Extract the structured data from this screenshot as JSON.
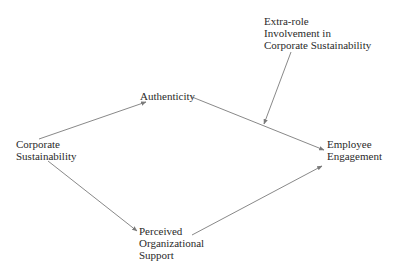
{
  "diagram": {
    "type": "path-model",
    "nodes": {
      "moderator": {
        "lines": [
          "Extra-role",
          "Involvement in",
          "Corporate Sustainability"
        ]
      },
      "authenticity": {
        "lines": [
          "Authenticity"
        ]
      },
      "corporate_sustainability": {
        "lines": [
          "Corporate",
          "Sustainability"
        ]
      },
      "employee_engagement": {
        "lines": [
          "Employee",
          "Engagement"
        ]
      },
      "perceived_org_support": {
        "lines": [
          "Perceived",
          "Organizational",
          "Support"
        ]
      }
    },
    "edges": [
      {
        "from": "Corporate Sustainability",
        "to": "Authenticity"
      },
      {
        "from": "Authenticity",
        "to": "Employee Engagement"
      },
      {
        "from": "Corporate Sustainability",
        "to": "Perceived Organizational Support"
      },
      {
        "from": "Perceived Organizational Support",
        "to": "Employee Engagement"
      },
      {
        "from": "Extra-role Involvement in Corporate Sustainability",
        "to": "Authenticity → Employee Engagement path",
        "kind": "moderation"
      }
    ],
    "colors": {
      "line": "#7a7a7a",
      "text": "#2a2a2a",
      "background": "#ffffff"
    }
  }
}
